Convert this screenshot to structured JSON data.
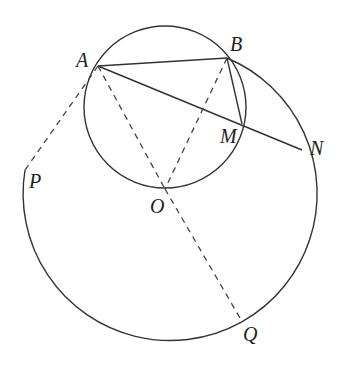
{
  "diagram": {
    "type": "geometry",
    "points": {
      "A": {
        "label": "A",
        "x": 98,
        "y": 66,
        "label_x": 76,
        "label_y": 67
      },
      "B": {
        "label": "B",
        "x": 227,
        "y": 58,
        "label_x": 230,
        "label_y": 51
      },
      "M": {
        "label": "M",
        "x": 242,
        "y": 124,
        "label_x": 220,
        "label_y": 143
      },
      "N": {
        "label": "N",
        "x": 302,
        "y": 150,
        "label_x": 310,
        "label_y": 155
      },
      "O": {
        "label": "O",
        "x": 165,
        "y": 189,
        "label_x": 150,
        "label_y": 213
      },
      "P": {
        "label": "P",
        "x": 25,
        "y": 170,
        "label_x": 29,
        "label_y": 188
      },
      "Q": {
        "label": "Q",
        "x": 240,
        "y": 318,
        "label_x": 243,
        "label_y": 341
      }
    },
    "circles": [
      {
        "name": "small-circle",
        "cx": 165,
        "cy": 107,
        "r": 81,
        "style": "solid"
      },
      {
        "name": "large-arc",
        "cx": 165,
        "cy": 190,
        "r": 147,
        "from": "B",
        "to": "P",
        "style": "solid"
      }
    ],
    "segments": [
      {
        "from": "A",
        "to": "B",
        "style": "solid"
      },
      {
        "from": "A",
        "to": "N",
        "style": "solid"
      },
      {
        "from": "B",
        "to": "M",
        "style": "solid"
      },
      {
        "from": "A",
        "to": "O",
        "style": "dashed"
      },
      {
        "from": "B",
        "to": "O",
        "style": "dashed"
      },
      {
        "from": "O",
        "to": "Q",
        "style": "dashed"
      },
      {
        "from": "A",
        "to": "P",
        "style": "dashed"
      }
    ],
    "colors": {
      "stroke": "#333333",
      "background": "#ffffff"
    }
  }
}
